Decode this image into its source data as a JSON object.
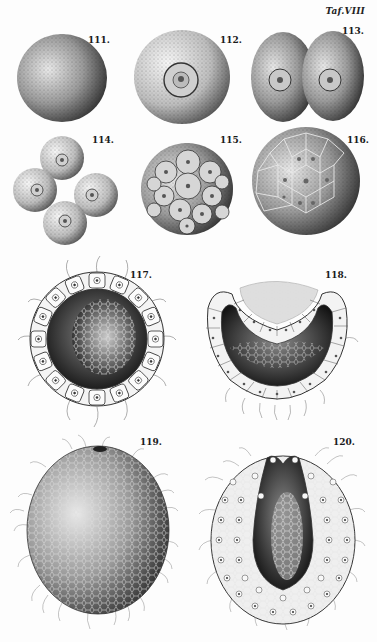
{
  "plate": {
    "title": "Taf.VIII"
  },
  "figures": [
    {
      "id": "fig-111",
      "label": "111.",
      "x": 88,
      "y": 35,
      "description": "undivided egg cell, stippled sphere"
    },
    {
      "id": "fig-112",
      "label": "112.",
      "x": 220,
      "y": 35,
      "description": "egg cell with nucleus"
    },
    {
      "id": "fig-113",
      "label": "113.",
      "x": 342,
      "y": 26,
      "description": "two-cell stage"
    },
    {
      "id": "fig-114",
      "label": "114.",
      "x": 92,
      "y": 135,
      "description": "four-cell stage"
    },
    {
      "id": "fig-115",
      "label": "115.",
      "x": 220,
      "y": 135,
      "description": "morula stage"
    },
    {
      "id": "fig-116",
      "label": "116.",
      "x": 347,
      "y": 135,
      "description": "blastula surface"
    },
    {
      "id": "fig-117",
      "label": "117.",
      "x": 130,
      "y": 270,
      "description": "blastula section with cilia"
    },
    {
      "id": "fig-118",
      "label": "118.",
      "x": 325,
      "y": 270,
      "description": "invaginating gastrula section"
    },
    {
      "id": "fig-119",
      "label": "119.",
      "x": 140,
      "y": 437,
      "description": "ciliated gastrula exterior"
    },
    {
      "id": "fig-120",
      "label": "120.",
      "x": 333,
      "y": 437,
      "description": "gastrula longitudinal section"
    }
  ],
  "colors": {
    "ink": "#1a1a1a",
    "paper": "#fdfdfd",
    "shade": "#555555"
  }
}
